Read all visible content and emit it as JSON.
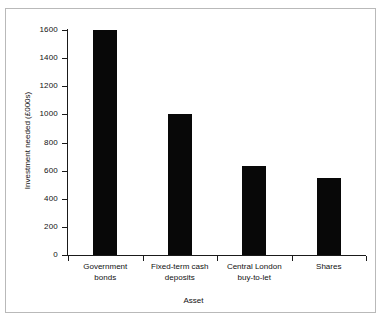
{
  "figure": {
    "frame_color": "#b9b9b9",
    "background": "#ffffff"
  },
  "chart_data": {
    "type": "bar",
    "title": "",
    "xlabel": "Asset",
    "ylabel": "Investment needed (£000s)",
    "categories": [
      "Government bonds",
      "Fixed-term cash deposits",
      "Central London buy-to-let",
      "Shares"
    ],
    "category_lines": [
      [
        "Government",
        "bonds"
      ],
      [
        "Fixed-term cash",
        "deposits"
      ],
      [
        "Central London",
        "buy-to-let"
      ],
      [
        "Shares",
        ""
      ]
    ],
    "values": [
      1600,
      1000,
      630,
      545
    ],
    "ylim": [
      0,
      1600
    ],
    "yticks": [
      0,
      200,
      400,
      600,
      800,
      1000,
      1200,
      1400,
      1600
    ],
    "ytick_labels": [
      "0",
      "200",
      "400",
      "600",
      "800",
      "1000",
      "1200",
      "1400",
      "1600"
    ],
    "grid": false,
    "legend": false,
    "bar_color": "#080808",
    "axis_color": "#1a1a1a"
  }
}
